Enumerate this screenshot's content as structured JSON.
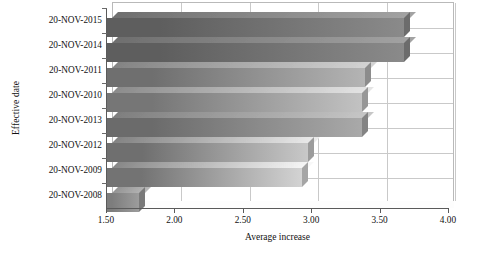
{
  "chart_data": {
    "type": "bar",
    "orientation": "horizontal",
    "title": "",
    "xlabel": "Average increase",
    "ylabel": "Effective date",
    "categories": [
      "20-NOV-2015",
      "20-NOV-2014",
      "20-NOV-2011",
      "20-NOV-2010",
      "20-NOV-2013",
      "20-NOV-2012",
      "20-NOV-2009",
      "20-NOV-2008"
    ],
    "values": [
      3.68,
      3.68,
      3.39,
      3.37,
      3.37,
      2.98,
      2.93,
      1.74
    ],
    "xlim": [
      1.5,
      4.0
    ],
    "xticks": [
      1.5,
      2.0,
      2.5,
      3.0,
      3.5,
      4.0
    ],
    "xtick_labels": [
      "1.50",
      "2.00",
      "2.50",
      "3.00",
      "3.50",
      "4.00"
    ],
    "grid": true,
    "grid_axis": "both",
    "legend": "none",
    "style": "3d",
    "bar_colors": [
      "#5e5e5e",
      "#5e5e5e",
      "#6f6f6f",
      "#767676",
      "#6b6b6b",
      "#6f6f6f",
      "#737373",
      "#7d7d7d"
    ],
    "bar_gradient_light": [
      "#8a8a8a",
      "#8a8a8a",
      "#b4b4b4",
      "#c2c2c2",
      "#a9a9a9",
      "#c8c8c8",
      "#d3d3d3",
      "#9c9c9c"
    ],
    "axis_color": "#5a5a5a",
    "grid_color": "#c9c9c9",
    "background": "#ffffff"
  }
}
